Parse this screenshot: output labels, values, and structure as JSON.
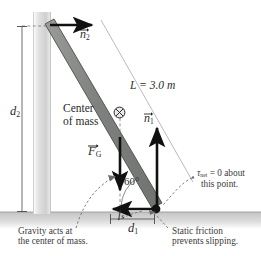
{
  "figure": {
    "type": "free-body-diagram"
  },
  "labels": {
    "d2": "d",
    "d2_sub": "2",
    "d1": "d",
    "d1_sub": "1",
    "length": "L = 3.0 m",
    "angle": "60°",
    "n2": "n",
    "n2_sub": "2",
    "n1": "n",
    "n1_sub": "1",
    "fg": "F",
    "fg_sub": "G",
    "fs": "f",
    "fs_sub": "s",
    "center_line1": "Center",
    "center_line2": "of mass",
    "torque_line1": "τ",
    "torque_sub": "net",
    "torque_line1_rest": " = 0 about",
    "torque_line2": "this point.",
    "gravity_line1": "Gravity acts at",
    "gravity_line2": "the center of mass.",
    "friction_line1": "Static friction",
    "friction_line2": "prevents slipping."
  },
  "values": {
    "beam_length_m": 3.0,
    "angle_deg": 60,
    "net_torque": 0
  },
  "colors": {
    "beam_fill": "#8a8d8a",
    "beam_edge": "#4a4d4a",
    "wall_fill": "#d8d8d8",
    "ground_fill": "#c9c9c9",
    "vector_color": "#111111",
    "text_color": "#2b2b2b",
    "dashed_color": "#7a7a7a"
  }
}
